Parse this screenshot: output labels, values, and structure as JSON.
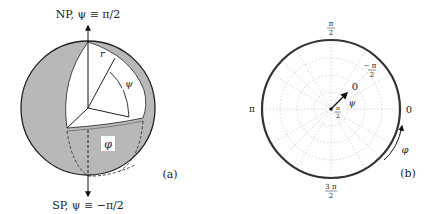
{
  "panel_a": {
    "caption": "(a)",
    "north_pole_label": "NP, ψ ≡ π/2",
    "south_pole_label": "SP, ψ ≡ −π/2",
    "radius_label": "r",
    "latitude_label": "ψ",
    "longitude_label": "φ",
    "colors": {
      "sphere_fill": "#b8b8b8",
      "cutaway_fill": "#ffffff",
      "outline": "#222222"
    }
  },
  "panel_b": {
    "caption": "(b)",
    "tick_top_num": "π",
    "tick_top_den": "2",
    "tick_left": "π",
    "tick_right": "0",
    "tick_bottom_num": "3 π",
    "tick_bottom_den": "2",
    "center_num": "π",
    "center_den": "2",
    "inner_minus_num": "− π",
    "inner_minus_den": "2",
    "arrow_tip_label": "0",
    "psi_label": "ψ",
    "phi_label": "φ",
    "colors": {
      "circle_stroke": "#333333",
      "grid": "#cccccc"
    }
  }
}
